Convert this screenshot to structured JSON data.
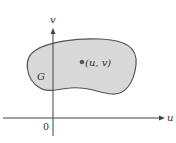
{
  "diagram": {
    "axes": {
      "horizontal_label": "u",
      "vertical_label": "v",
      "origin_label": "0"
    },
    "region": {
      "label": "G",
      "fill_color": "#d9d9d9",
      "stroke_color": "#555555"
    },
    "point": {
      "label": "(u, v)",
      "color": "#555555"
    },
    "axis_color": "#444444"
  }
}
